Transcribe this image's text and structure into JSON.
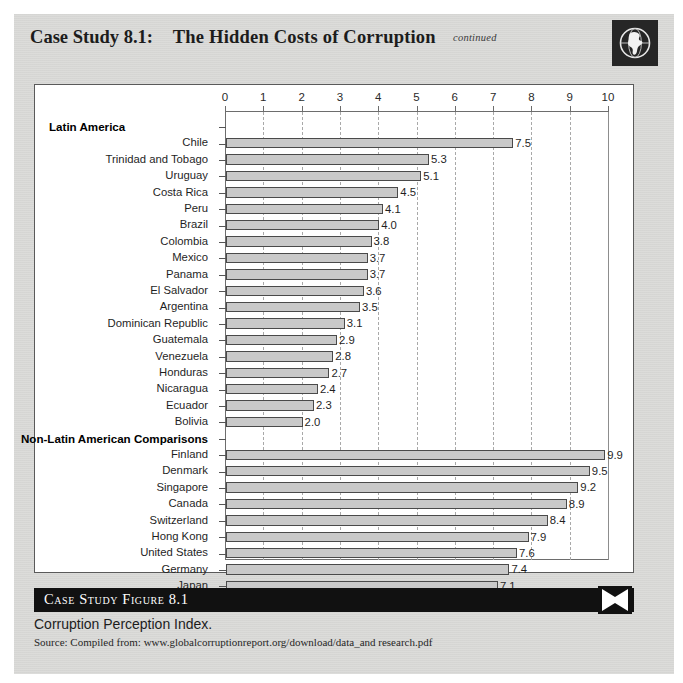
{
  "header": {
    "case_label": "Case Study 8.1:",
    "title": "The Hidden Costs of Corruption",
    "continued": "continued",
    "globe_icon": "globe-americas-icon"
  },
  "caption": {
    "bar_label": "Case Study Figure 8.1",
    "title": "Corruption Perception Index.",
    "source": "Source: Compiled from: www.globalcorruptionreport.org/download/data_and research.pdf",
    "end_icon": "x-mark-icon"
  },
  "colors": {
    "page_background": "#d8d8d6",
    "chart_background": "#ffffff",
    "bar_fill": "#c9c9c9",
    "bar_stroke": "#4a4a4a",
    "axis": "#6d6d6d",
    "gridline": "#a9a9a9",
    "caption_bar": "#111111",
    "globe_box": "#262626"
  },
  "chart_data": {
    "type": "bar",
    "orientation": "horizontal",
    "title": "Corruption Perception Index.",
    "xlabel": "",
    "ylabel": "",
    "xlim": [
      0,
      10
    ],
    "xticks": [
      0,
      1,
      2,
      3,
      4,
      5,
      6,
      7,
      8,
      9,
      10
    ],
    "grid": "vertical-dashed",
    "legend": "none",
    "groups": [
      {
        "name": "Latin America",
        "label_align": "left",
        "categories": [
          "Chile",
          "Trinidad and Tobago",
          "Uruguay",
          "Costa Rica",
          "Peru",
          "Brazil",
          "Colombia",
          "Mexico",
          "Panama",
          "El Salvador",
          "Argentina",
          "Dominican Republic",
          "Guatemala",
          "Venezuela",
          "Honduras",
          "Nicaragua",
          "Ecuador",
          "Bolivia"
        ],
        "values": [
          7.5,
          5.3,
          5.1,
          4.5,
          4.1,
          4.0,
          3.8,
          3.7,
          3.7,
          3.6,
          3.5,
          3.1,
          2.9,
          2.8,
          2.7,
          2.4,
          2.3,
          2.0
        ],
        "value_labels": [
          "7.5",
          "5.3",
          "5.1",
          "4.5",
          "4.1",
          "4.0",
          "3.8",
          "3.7",
          "3.7",
          "3.6",
          "3.5",
          "3.1",
          "2.9",
          "2.8",
          "2.7",
          "2.4",
          "2.3",
          "2.0"
        ]
      },
      {
        "name": "Non-Latin American Comparisons",
        "label_align": "right",
        "categories": [
          "Finland",
          "Denmark",
          "Singapore",
          "Canada",
          "Switzerland",
          "Hong Kong",
          "United States",
          "Germany",
          "Japan"
        ],
        "values": [
          9.9,
          9.5,
          9.2,
          8.9,
          8.4,
          7.9,
          7.6,
          7.4,
          7.1
        ],
        "value_labels": [
          "9.9",
          "9.5",
          "9.2",
          "8.9",
          "8.4",
          "7.9",
          "7.6",
          "7.4",
          "7.1"
        ]
      }
    ]
  }
}
